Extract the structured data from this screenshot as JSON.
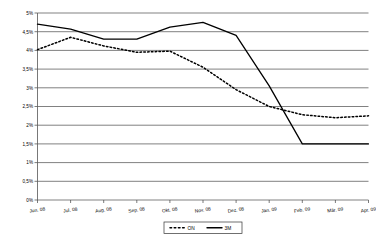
{
  "chart_data": {
    "type": "line",
    "title": "",
    "subtitle": "",
    "xlabel": "",
    "ylabel": "",
    "categories": [
      "Jun. 08",
      "Jul. 08",
      "Aug. 08",
      "Sep. 08",
      "Okt. 08",
      "Nov. 08",
      "Dez. 08",
      "Jan. 09",
      "Feb. 09",
      "Mär. 09",
      "Apr. 09"
    ],
    "ylim": [
      0,
      5
    ],
    "ytick_step": 0.5,
    "ytick_labels": [
      "0%",
      "0,5%",
      "1%",
      "1,5%",
      "2%",
      "2,5%",
      "3%",
      "3,5%",
      "4%",
      "4,5%",
      "5%"
    ],
    "ytick_values": [
      0,
      0.5,
      1,
      1.5,
      2,
      2.5,
      3,
      3.5,
      4,
      4.5,
      5
    ],
    "grid": true,
    "grid_axis": "y",
    "legend_position": "bottom",
    "series": [
      {
        "name": "ON",
        "style": "dotted",
        "color": "#000000",
        "values": [
          4.02,
          4.35,
          4.12,
          3.95,
          3.98,
          3.55,
          2.95,
          2.5,
          2.28,
          2.2,
          2.25
        ]
      },
      {
        "name": "3M",
        "style": "solid",
        "color": "#000000",
        "values": [
          4.7,
          4.57,
          4.3,
          4.3,
          4.62,
          4.75,
          4.4,
          3.05,
          1.5,
          1.5,
          1.5
        ]
      }
    ]
  },
  "legend": {
    "entries": [
      {
        "label": "ON",
        "style": "dotted"
      },
      {
        "label": "3M",
        "style": "solid"
      }
    ]
  }
}
